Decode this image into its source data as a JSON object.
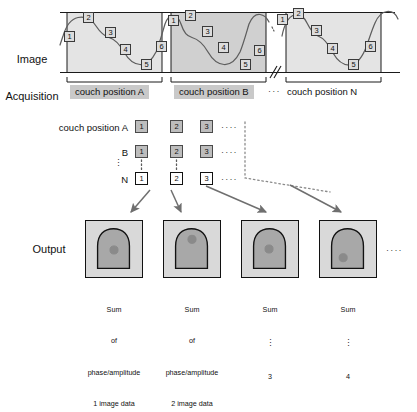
{
  "figure": {
    "title_semantic": "4D image acquisition and phase/amplitude binning workflow"
  },
  "acquisition": {
    "label": "Image\nAcquisition",
    "label_line1": "Image",
    "label_line2": "Acquisition",
    "bin_numbers": [
      "1",
      "2",
      "3",
      "4",
      "5",
      "6"
    ],
    "couch_positions": [
      {
        "name": "couch-position-a",
        "label": "couch position A",
        "highlight": true
      },
      {
        "name": "couch-position-b",
        "label": "couch position B",
        "highlight": true
      },
      {
        "name": "couch-position-n",
        "label": "couch position N",
        "highlight": false
      }
    ],
    "break_ellipsis": "···"
  },
  "matrix": {
    "rows": [
      {
        "name": "row-a",
        "label": "couch position A",
        "cells": [
          "1",
          "2",
          "3"
        ],
        "trailing": "····",
        "open": false
      },
      {
        "name": "row-b",
        "label": "B",
        "cells": [
          "1",
          "2",
          "3"
        ],
        "trailing": "····",
        "open": false
      },
      {
        "name": "row-n",
        "label": "N",
        "cells": [
          "1",
          "2",
          "3"
        ],
        "trailing": "····",
        "open": true
      }
    ],
    "vertical_dots": "⋮"
  },
  "output": {
    "label": "Output",
    "trailing_ellipsis": "····",
    "images": [
      {
        "name": "output-image-1",
        "caption_lines": [
          "Sum",
          "of",
          "phase/amplitude",
          "1 image data"
        ],
        "blob_x": 29,
        "blob_y": 30
      },
      {
        "name": "output-image-2",
        "caption_lines": [
          "Sum",
          "of",
          "phase/amplitude",
          "2 image data"
        ],
        "blob_x": 29,
        "blob_y": 19
      },
      {
        "name": "output-image-3",
        "caption_lines": [
          "Sum",
          "⋮",
          "3"
        ],
        "blob_x": 28,
        "blob_y": 29
      },
      {
        "name": "output-image-4",
        "caption_lines": [
          "Sum",
          "⋮",
          "4"
        ],
        "blob_x": 24,
        "blob_y": 38
      }
    ]
  },
  "colors": {
    "panel_fill_light": "#e6e6e6",
    "panel_fill_dark": "#d2d2d2",
    "chip_fill": "#dcdcdc",
    "grid_chip_fill": "#bdbdbd",
    "couch_tag_bg": "#c9c9c9",
    "stroke": "#1a1a1a",
    "arrow": "#666666",
    "organ_fill": "#a8a8a8",
    "lesion_fill": "#8a8a8a"
  }
}
